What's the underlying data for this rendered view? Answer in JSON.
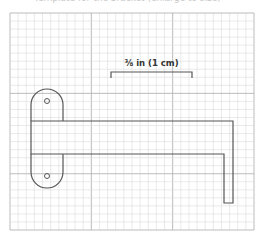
{
  "caption": {
    "text": "Template for the bracket (enlarge to size)"
  },
  "scale": {
    "label": "⅜ in (1 cm)",
    "bar_x1": 111,
    "bar_x2": 192,
    "bar_y": 72
  },
  "grid": {
    "x": 10,
    "y": 13,
    "width": 244,
    "height": 217,
    "cell": 8.13,
    "minor_color": "#dcdcdc",
    "major_color": "#b4b4b4"
  },
  "bracket": {
    "stroke_color": "#555555",
    "plate": {
      "left": 31,
      "right": 63,
      "top": 89,
      "bottom": 188
    },
    "arm": {
      "top": 121,
      "bottom": 154,
      "right": 233,
      "inner_x": 224,
      "leg_bottom": 203
    },
    "holes": [
      {
        "name": "upper-screw-hole",
        "cx": 47,
        "cy": 101,
        "r": 2.5
      },
      {
        "name": "lower-screw-hole",
        "cx": 47,
        "cy": 176,
        "r": 2.5
      }
    ]
  }
}
